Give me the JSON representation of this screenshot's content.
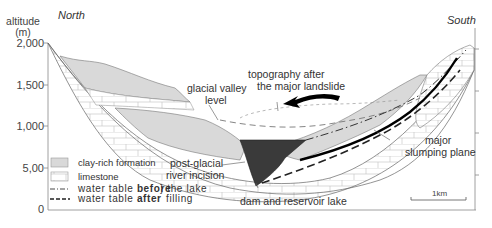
{
  "figure": {
    "y_axis": {
      "title_line1": "altitude",
      "title_line2": "(m)",
      "ticks": [
        "2,000",
        "1,500",
        "1,000",
        "5,00",
        "0"
      ]
    },
    "directions": {
      "left": "North",
      "right": "South"
    },
    "annotations": {
      "glacial_level_line1": "glacial valley",
      "glacial_level_line2": "level",
      "topography_line1": "topography after",
      "topography_line2": "the major landslide",
      "incision_line1": "post-glacial",
      "incision_line2": "river incision",
      "dam": "dam and reservoir lake",
      "slump_line1": "major",
      "slump_line2": "slumping plane",
      "lake_filling_line1": "the lake",
      "lake_filling_line2": "filling"
    },
    "legend": {
      "clay": "clay-rich formation",
      "limestone": "limestone",
      "wt_before_prefix": "water table ",
      "wt_before_bold": "before",
      "wt_after_prefix": "water table ",
      "wt_after_bold": "after"
    },
    "scale_bar": "1km",
    "colors": {
      "clay_fill": "#d9d9d9",
      "lake_fill": "#3a3a3a",
      "line": "#555555",
      "axis": "#888888"
    }
  }
}
